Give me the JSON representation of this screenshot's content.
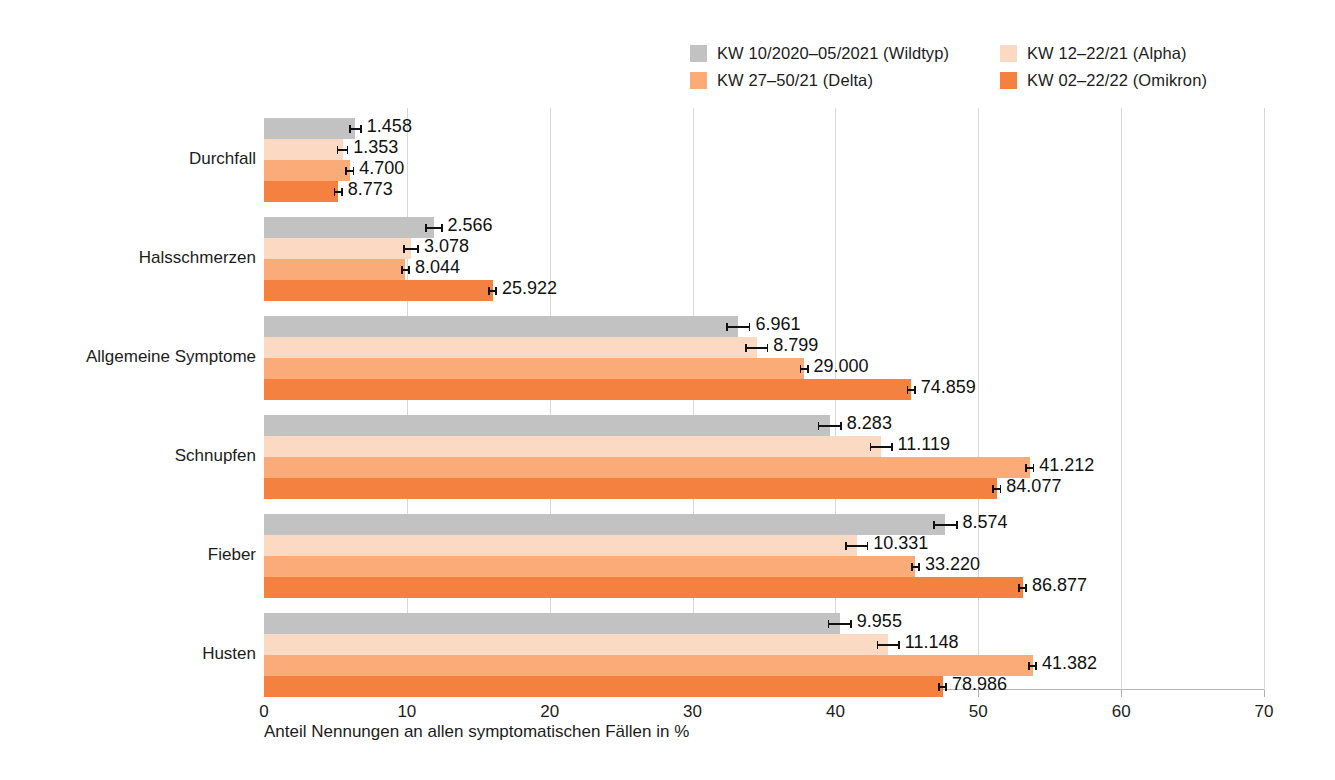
{
  "chart_data": {
    "type": "bar",
    "orientation": "horizontal",
    "title": "",
    "xlabel": "Anteil Nennungen an allen symptomatischen Fällen in %",
    "ylabel": "",
    "xlim": [
      0,
      70
    ],
    "xticks": [
      0,
      10,
      20,
      30,
      40,
      50,
      60,
      70
    ],
    "xtick_labels": [
      "0",
      "10",
      "20",
      "30",
      "40",
      "50",
      "60",
      "70"
    ],
    "grid": "vertical",
    "legend_position": "top-right",
    "categories": [
      "Durchfall",
      "Halsschmerzen",
      "Allgemeine Symptome",
      "Schnupfen",
      "Fieber",
      "Husten"
    ],
    "series": [
      {
        "name": "KW 10/2020–05/2021 (Wildtyp)",
        "color": "#bdbdbd",
        "values": [
          6.4,
          11.9,
          33.2,
          39.6,
          47.7,
          40.3
        ],
        "data_labels": [
          "1.458",
          "2.566",
          "6.961",
          "8.283",
          "8.574",
          "9.955"
        ]
      },
      {
        "name": "KW 12–22/21 (Alpha)",
        "color": "#fbd7bf",
        "values": [
          5.5,
          10.3,
          34.5,
          43.2,
          43.4,
          43.7
        ],
        "data_labels": [
          "1.353",
          "3.078",
          "8.799",
          "11.119",
          "10.331",
          "11.148"
        ]
      },
      {
        "name": "KW 27–50/21 (Delta)",
        "color": "#f9a濃"
      }
    ]
  },
  "chart": {
    "xlabel": "Anteil Nennungen an allen symptomatischen Fällen in %",
    "xticks": [
      "0",
      "10",
      "20",
      "30",
      "40",
      "50",
      "60",
      "70"
    ],
    "xtick_values": [
      0,
      10,
      20,
      30,
      40,
      50,
      60,
      70
    ],
    "xlim_max": 70,
    "categories": [
      {
        "label": "Durchfall",
        "bars": [
          {
            "series": 0,
            "pct": 6.4,
            "label": "1.458",
            "err": 0.45
          },
          {
            "series": 1,
            "pct": 5.5,
            "label": "1.353",
            "err": 0.4
          },
          {
            "series": 2,
            "pct": 6.0,
            "label": "4.700",
            "err": 0.22
          },
          {
            "series": 3,
            "pct": 5.2,
            "label": "8.773",
            "err": 0.18
          }
        ]
      },
      {
        "label": "Halsschmerzen",
        "bars": [
          {
            "series": 0,
            "pct": 11.9,
            "label": "2.566",
            "err": 0.6
          },
          {
            "series": 1,
            "pct": 10.3,
            "label": "3.078",
            "err": 0.55
          },
          {
            "series": 2,
            "pct": 9.9,
            "label": "8.044",
            "err": 0.28
          },
          {
            "series": 3,
            "pct": 16.0,
            "label": "25.922",
            "err": 0.22
          }
        ]
      },
      {
        "label": "Allgemeine Symptome",
        "bars": [
          {
            "series": 0,
            "pct": 33.2,
            "label": "6.961",
            "err": 0.85
          },
          {
            "series": 1,
            "pct": 34.5,
            "label": "8.799",
            "err": 0.8
          },
          {
            "series": 2,
            "pct": 37.8,
            "label": "29.000",
            "err": 0.3
          },
          {
            "series": 3,
            "pct": 45.3,
            "label": "74.859",
            "err": 0.22
          }
        ]
      },
      {
        "label": "Schnupfen",
        "bars": [
          {
            "series": 0,
            "pct": 39.6,
            "label": "8.283",
            "err": 0.85
          },
          {
            "series": 1,
            "pct": 43.2,
            "label": "11.119",
            "err": 0.8
          },
          {
            "series": 2,
            "pct": 53.6,
            "label": "41.212",
            "err": 0.3
          },
          {
            "series": 3,
            "pct": 51.3,
            "label": "84.077",
            "err": 0.22
          }
        ]
      },
      {
        "label": "Fieber",
        "bars": [
          {
            "series": 0,
            "pct": 47.7,
            "label": "8.574",
            "err": 0.85
          },
          {
            "series": 1,
            "pct": 41.5,
            "label": "10.331",
            "err": 0.8
          },
          {
            "series": 2,
            "pct": 45.6,
            "label": "33.220",
            "err": 0.3
          },
          {
            "series": 3,
            "pct": 53.1,
            "label": "86.877",
            "err": 0.22
          }
        ]
      },
      {
        "label": "Husten",
        "bars": [
          {
            "series": 0,
            "pct": 40.3,
            "label": "9.955",
            "err": 0.85
          },
          {
            "series": 1,
            "pct": 43.7,
            "label": "11.148",
            "err": 0.8
          },
          {
            "series": 2,
            "pct": 53.8,
            "label": "41.382",
            "err": 0.3
          },
          {
            "series": 3,
            "pct": 47.5,
            "label": "78.986",
            "err": 0.22
          }
        ]
      }
    ]
  },
  "legend": {
    "items": [
      {
        "label": "KW 10/2020–05/2021 (Wildtyp)",
        "color": "#c2c2c2"
      },
      {
        "label": "KW 12–22/21 (Alpha)",
        "color": "#fbd9c3"
      },
      {
        "label": "KW 27–50/21 (Delta)",
        "color": "#fbab77"
      },
      {
        "label": "KW 02–22/22 (Omikron)",
        "color": "#f4813f"
      }
    ]
  },
  "colors": {
    "wildtyp": "#c2c2c2",
    "alpha": "#fbd9c3",
    "delta": "#fbab77",
    "omikron": "#f4813f",
    "grid": "#d8d8d8",
    "text": "#1c1c1c"
  }
}
